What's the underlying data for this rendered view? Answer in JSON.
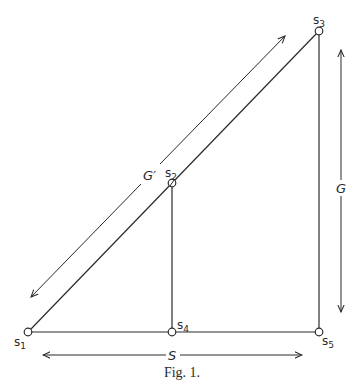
{
  "figure": {
    "caption": "Fig. 1.",
    "colors": {
      "ink": "#2a2a2a",
      "background": "#ffffff"
    },
    "nodes": [
      {
        "id": "s1",
        "label": "s",
        "subscript": "1",
        "x": 28,
        "y": 332
      },
      {
        "id": "s2",
        "label": "s",
        "subscript": "2",
        "x": 172,
        "y": 183
      },
      {
        "id": "s3",
        "label": "s",
        "subscript": "3",
        "x": 319,
        "y": 31
      },
      {
        "id": "s4",
        "label": "s",
        "subscript": "4",
        "x": 172,
        "y": 332
      },
      {
        "id": "s5",
        "label": "s",
        "subscript": "5",
        "x": 319,
        "y": 332
      }
    ],
    "edges": [
      {
        "from": "s1",
        "to": "s3"
      },
      {
        "from": "s1",
        "to": "s5"
      },
      {
        "from": "s2",
        "to": "s4"
      },
      {
        "from": "s3",
        "to": "s5"
      }
    ],
    "dimensions": [
      {
        "id": "G-prime",
        "label": "G′",
        "orientation": "diagonal",
        "description": "length along s1–s3"
      },
      {
        "id": "G",
        "label": "G",
        "orientation": "vertical",
        "description": "height s3–s5"
      },
      {
        "id": "S",
        "label": "S",
        "orientation": "horizontal",
        "description": "distance s1–s5"
      }
    ]
  }
}
